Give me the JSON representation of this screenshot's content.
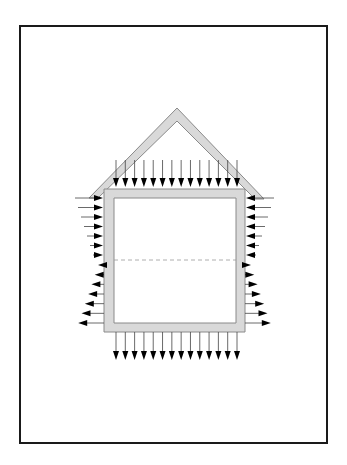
{
  "diagram": {
    "type": "wind-load-on-house-section",
    "colors": {
      "frame": "#1a1a1a",
      "wall_fill": "#d9d9d9",
      "wall_stroke": "#8a8a8a",
      "arrow": "#000000",
      "arrow_line": "#444444",
      "dashed_line": "#999999",
      "background": "#ffffff"
    },
    "frame": {
      "x": 20,
      "y": 26,
      "w": 307,
      "h": 417
    },
    "house": {
      "outer": {
        "x": 104,
        "y": 189,
        "w": 141,
        "h": 143
      },
      "inner": {
        "x": 114,
        "y": 198,
        "w": 122,
        "h": 125
      },
      "roof": {
        "apex_outer": [
          177,
          108
        ],
        "apex_inner": [
          177,
          121
        ],
        "left_tip": [
          89,
          198
        ],
        "right_tip": [
          264,
          199
        ]
      },
      "midline_y": 260
    },
    "arrows": {
      "top": {
        "count": 14,
        "direction": "down",
        "x_start": 116,
        "x_end": 237,
        "tail_y": 160,
        "tip_y": 187
      },
      "bottom": {
        "count": 14,
        "direction": "down",
        "x_start": 116,
        "x_end": 237,
        "tail_y": 332,
        "tip_y": 360
      },
      "left_upper": {
        "count": 7,
        "direction": "right",
        "y_start": 198,
        "y_end": 255,
        "tip_x": 103
      },
      "left_lower": {
        "count": 7,
        "direction": "left",
        "y_start": 265,
        "y_end": 323,
        "base_x": 104
      },
      "right_upper": {
        "count": 7,
        "direction": "left",
        "y_start": 198,
        "y_end": 255,
        "tip_x": 246
      },
      "right_lower": {
        "count": 7,
        "direction": "right",
        "y_start": 265,
        "y_end": 323,
        "base_x": 245
      }
    }
  }
}
